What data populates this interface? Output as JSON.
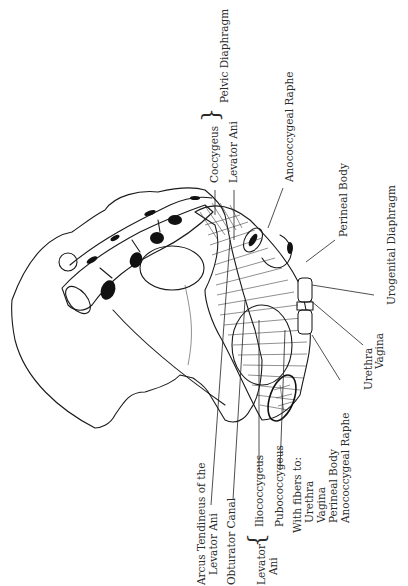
{
  "figure": {
    "orientation": "rotated -90deg"
  },
  "labels": {
    "pelvic_diaphragm_group": {
      "coccygeus": "Coccygeus",
      "levator_ani": "Levator Ani",
      "group_name": "Pelvic Diaphragm"
    },
    "anococcygeal_raphe": "Anococcygeal Raphe",
    "perineal_body": "Perineal Body",
    "urogenital_diaphragm": "Urogenital Diaphragm",
    "urethra": "Urethra",
    "vagina": "Vagina",
    "arcus_tendineus": {
      "line1": "Arcus Tendineus of the",
      "line2": "Levator Ani"
    },
    "obturator_canal": "Obturator Canal",
    "levator_ani_group": {
      "line1": "Levator",
      "line2": "Ani",
      "iliococcygeus": "Iliococcygeus",
      "pubococcygeus": "Pubococcygeus"
    },
    "fibers": {
      "heading": "With fibers to:",
      "items": [
        "Urethra",
        "Vagina",
        "Perineal Body",
        "Anococcygeal Raphe"
      ]
    }
  }
}
